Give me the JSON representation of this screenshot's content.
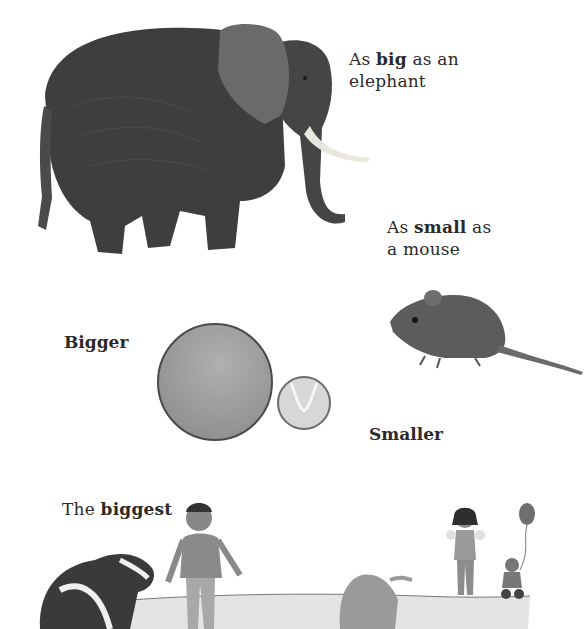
{
  "page": {
    "background": "#ffffff",
    "text_color": "#2a2a2a"
  },
  "elephant_section": {
    "caption_prefix": "As ",
    "caption_bold": "big",
    "caption_suffix": " as an",
    "caption_line2": "elephant",
    "image": "elephant-photo"
  },
  "mouse_section": {
    "caption_prefix": "As ",
    "caption_bold": "small",
    "caption_suffix": " as",
    "caption_line2": "a mouse",
    "image": "mouse-photo"
  },
  "balls_section": {
    "bigger_label": "Bigger",
    "smaller_label": "Smaller",
    "big_ball": "large-ball",
    "small_ball": "tennis-ball"
  },
  "biggest_section": {
    "caption_prefix": "The ",
    "caption_bold": "biggest",
    "illustration": "park-scene"
  }
}
